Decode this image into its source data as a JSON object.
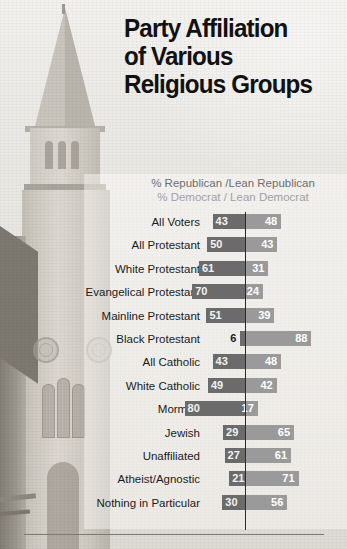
{
  "title": {
    "line1": "Party Affiliation",
    "line2": "of Various",
    "line3": "Religious Groups"
  },
  "legend": {
    "republican": "% Republican /Lean Republican",
    "democrat": "% Democrat / Lean Democrat"
  },
  "colors": {
    "republican_bar": "#6b6b6b",
    "democrat_bar": "#9a9a9a",
    "divider": "#2b2b2b",
    "title_text": "#111111",
    "label_text": "#1b1b1b"
  },
  "chart_data": {
    "type": "bar",
    "title": "Party Affiliation of Various Religious Groups",
    "subtitle": "",
    "xlabel": "",
    "ylabel": "",
    "orientation": "horizontal-diverging",
    "grid": false,
    "legend_position": "top-center",
    "axis_center": 0,
    "xlim": [
      -90,
      90
    ],
    "categories": [
      "All Voters",
      "All Protestant",
      "White Protestant",
      "Evangelical Protestant",
      "Mainline Protestant",
      "Black Protestant",
      "All Catholic",
      "White Catholic",
      "Mormon",
      "Jewish",
      "Unaffiliated",
      "Atheist/Agnostic",
      "Nothing in Particular"
    ],
    "series": [
      {
        "name": "% Republican /Lean Republican",
        "color": "#6b6b6b",
        "values": [
          43,
          50,
          61,
          70,
          51,
          6,
          43,
          49,
          80,
          29,
          27,
          21,
          30
        ]
      },
      {
        "name": "% Democrat / Lean Democrat",
        "color": "#9a9a9a",
        "values": [
          48,
          43,
          31,
          24,
          39,
          88,
          48,
          42,
          17,
          65,
          61,
          71,
          56
        ]
      }
    ]
  },
  "rows": [
    {
      "label": "All Voters",
      "rep": 43,
      "dem": 48,
      "rep_label_outside": false
    },
    {
      "label": "All Protestant",
      "rep": 50,
      "dem": 43,
      "rep_label_outside": false
    },
    {
      "label": "White Protestant",
      "rep": 61,
      "dem": 31,
      "rep_label_outside": false
    },
    {
      "label": "Evangelical Protestant",
      "rep": 70,
      "dem": 24,
      "rep_label_outside": false
    },
    {
      "label": "Mainline Protestant",
      "rep": 51,
      "dem": 39,
      "rep_label_outside": false
    },
    {
      "label": "Black Protestant",
      "rep": 6,
      "dem": 88,
      "rep_label_outside": true
    },
    {
      "label": "All Catholic",
      "rep": 43,
      "dem": 48,
      "rep_label_outside": false
    },
    {
      "label": "White Catholic",
      "rep": 49,
      "dem": 42,
      "rep_label_outside": false
    },
    {
      "label": "Mormon",
      "rep": 80,
      "dem": 17,
      "rep_label_outside": false
    },
    {
      "label": "Jewish",
      "rep": 29,
      "dem": 65,
      "rep_label_outside": false
    },
    {
      "label": "Unaffiliated",
      "rep": 27,
      "dem": 61,
      "rep_label_outside": false
    },
    {
      "label": "Atheist/Agnostic",
      "rep": 21,
      "dem": 71,
      "rep_label_outside": false
    },
    {
      "label": "Nothing in Particular",
      "rep": 30,
      "dem": 56,
      "rep_label_outside": false
    }
  ],
  "background": {
    "photo_subject": "church-steeple-photo"
  }
}
